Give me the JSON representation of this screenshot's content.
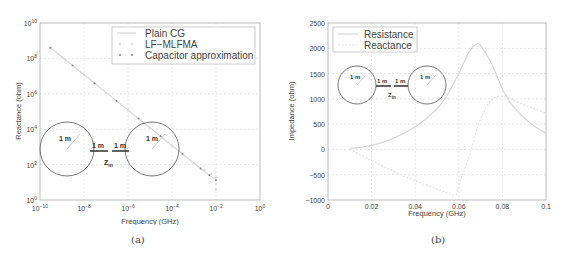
{
  "chart_data": [
    {
      "id": "a",
      "type": "line",
      "caption": "(a)",
      "title": "",
      "xlabel": "Frequency (GHz)",
      "ylabel": "Reactance (ohm)",
      "xscale": "log",
      "yscale": "log",
      "xlim": [
        1e-10,
        1
      ],
      "ylim": [
        1,
        10000000000.0
      ],
      "grid": true,
      "legend_position": "upper right",
      "x_tick_labels": [
        "10^-10",
        "10^-8",
        "10^-6",
        "10^-4",
        "10^-2",
        "10^0"
      ],
      "y_tick_labels": [
        "10^0",
        "10^2",
        "10^4",
        "10^6",
        "10^8",
        "10^10"
      ],
      "series": [
        {
          "name": "Plain CG",
          "style": "solid line",
          "x": [
            3e-10,
            1e-09,
            1e-08,
            1e-07,
            1e-06,
            1e-05,
            0.0001,
            0.001,
            0.005,
            0.01
          ],
          "y": [
            400000000.0,
            120000000.0,
            12000000.0,
            1200000.0,
            120000.0,
            12000.0,
            1200.0,
            120.0,
            25,
            15
          ]
        },
        {
          "name": "LF-MLFMA",
          "style": "circle markers",
          "x": [
            3e-10,
            1e-09,
            1e-08,
            1e-07,
            1e-06,
            1e-05,
            0.0001,
            0.001,
            0.003,
            0.006,
            0.01,
            0.01,
            0.01
          ],
          "y": [
            400000000.0,
            120000000.0,
            12000000.0,
            1200000.0,
            120000.0,
            12000.0,
            1200.0,
            120.0,
            50,
            30,
            20,
            8,
            4
          ]
        },
        {
          "name": "Capacitor approximation",
          "style": "dot markers",
          "x": [
            3e-10,
            3e-09,
            3e-08,
            3e-07,
            3e-06,
            3e-05,
            0.0003,
            0.002,
            0.005,
            0.01
          ],
          "y": [
            400000000.0,
            40000000.0,
            4000000.0,
            400000.0,
            40000.0,
            4000.0,
            400.0,
            60,
            25,
            13
          ]
        }
      ],
      "annotations": [
        "1 m",
        "1 m",
        "1 m",
        "1 m",
        "Z_in"
      ]
    },
    {
      "id": "b",
      "type": "line",
      "caption": "(b)",
      "title": "",
      "xlabel": "Frequency (GHz)",
      "ylabel": "Impedance (ohm)",
      "xscale": "linear",
      "yscale": "linear",
      "xlim": [
        0,
        0.1
      ],
      "ylim": [
        -1000,
        2500
      ],
      "grid": true,
      "legend_position": "upper left",
      "x_tick_labels": [
        "0",
        "0.02",
        "0.04",
        "0.06",
        "0.08",
        "0.1"
      ],
      "y_tick_labels": [
        "-1000",
        "-500",
        "0",
        "500",
        "1000",
        "1500",
        "2000",
        "2500"
      ],
      "series": [
        {
          "name": "Resistance",
          "x": [
            0.01,
            0.02,
            0.03,
            0.04,
            0.05,
            0.055,
            0.06,
            0.065,
            0.068,
            0.07,
            0.075,
            0.08,
            0.085,
            0.09,
            0.095,
            0.1
          ],
          "y": [
            20,
            80,
            220,
            450,
            800,
            1100,
            1500,
            1950,
            2080,
            2050,
            1700,
            1200,
            850,
            620,
            450,
            320
          ]
        },
        {
          "name": "Reactance",
          "x": [
            0.01,
            0.02,
            0.03,
            0.04,
            0.05,
            0.058,
            0.06,
            0.065,
            0.07,
            0.075,
            0.08,
            0.085,
            0.09,
            0.095,
            0.1
          ],
          "y": [
            0,
            -220,
            -430,
            -620,
            -780,
            -900,
            -700,
            -100,
            600,
            980,
            1050,
            980,
            880,
            800,
            720
          ]
        }
      ],
      "annotations": [
        "1 m",
        "1 m",
        "1 m",
        "1 m",
        "Z_in"
      ]
    }
  ],
  "panels": {
    "a": {
      "caption": "(a)",
      "xlabel": "Frequency (GHz)",
      "ylabel": "Reactance (ohm)",
      "legend": [
        "Plain CG",
        "LF−MLFMA",
        "Capacitor approximation"
      ],
      "inset": {
        "r1": "1 m",
        "l1": "1 m",
        "l2": "1 m",
        "r2": "1 m",
        "z": "Z",
        "zsub": "in"
      }
    },
    "b": {
      "caption": "(b)",
      "xlabel": "Frequency (GHz)",
      "ylabel": "Impedance (ohm)",
      "legend": [
        "Resistance",
        "Reactance"
      ],
      "inset": {
        "r1": "1 m",
        "l1": "1 m",
        "l2": "1 m",
        "r2": "1 m",
        "z": "Z",
        "zsub": "in"
      }
    }
  },
  "colors": {
    "axis": "#999999",
    "grid": "#cccccc",
    "text": "#444444",
    "series_light": "#d8d8d8",
    "series_marker": "#aaaaaa",
    "inset": "#555555"
  }
}
